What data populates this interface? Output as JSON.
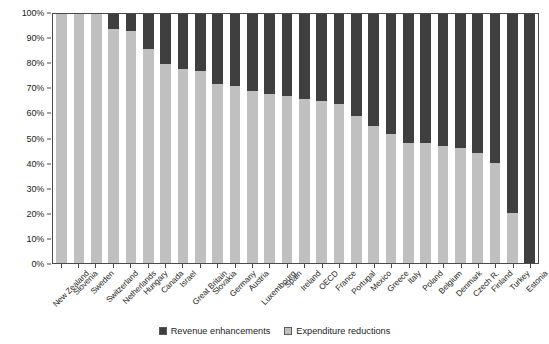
{
  "chart_data": {
    "type": "bar",
    "stacked": true,
    "title": "",
    "subtitle": "",
    "xlabel": "",
    "ylabel": "",
    "ylim": [
      0,
      100
    ],
    "ytick_labels": [
      "100%",
      "90%",
      "80%",
      "70%",
      "60%",
      "50%",
      "40%",
      "30%",
      "20%",
      "10%",
      "0%"
    ],
    "ytick_values": [
      100,
      90,
      80,
      70,
      60,
      50,
      40,
      30,
      20,
      10,
      0
    ],
    "grid": false,
    "legend_position": "bottom",
    "legend": [
      "Revenue enhancements",
      "Expenditure reductions"
    ],
    "colors": {
      "revenue_enhancements": "#3f3f3f",
      "expenditure_reductions": "#c0c0c0",
      "axis": "#4a4a4a",
      "text": "#1c1c1c",
      "background": "#ffffff"
    },
    "categories": [
      "New Zealand",
      "Slovenia",
      "Sweden",
      "Switzerland",
      "Netherlands",
      "Hungary",
      "Canada",
      "Israel",
      "Great Britain",
      "Slovakia",
      "Germany",
      "Austria",
      "Luxembourg",
      "Spain",
      "Ireland",
      "OECD",
      "France",
      "Portugal",
      "Mexico",
      "Greece",
      "Italy",
      "Poland",
      "Belgium",
      "Denmark",
      "Czech R.",
      "Finland",
      "Turkey",
      "Estonia"
    ],
    "series": [
      {
        "name": "Expenditure reductions",
        "key": "expenditure_reductions",
        "values": [
          100,
          100,
          100,
          94,
          93,
          86,
          80,
          78,
          77,
          72,
          71,
          69,
          68,
          67,
          66,
          65,
          64,
          59,
          55,
          52,
          48,
          48,
          47,
          46,
          44,
          40,
          20,
          0
        ]
      },
      {
        "name": "Revenue enhancements",
        "key": "revenue_enhancements",
        "values": [
          0,
          0,
          0,
          6,
          7,
          14,
          20,
          22,
          23,
          28,
          29,
          31,
          32,
          33,
          34,
          35,
          36,
          41,
          45,
          48,
          52,
          52,
          53,
          54,
          56,
          60,
          80,
          100
        ]
      }
    ]
  },
  "legend": {
    "items": [
      {
        "label": "Revenue enhancements",
        "swatch": "dark-square-icon"
      },
      {
        "label": "Expenditure reductions",
        "swatch": "light-square-icon"
      }
    ]
  }
}
